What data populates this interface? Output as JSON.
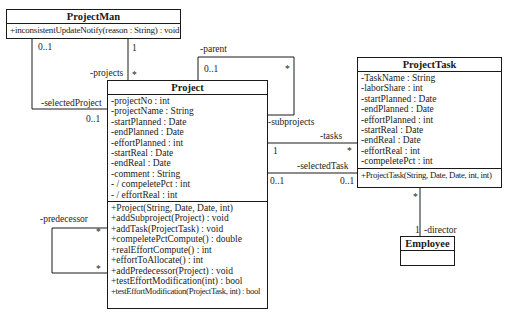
{
  "classes": {
    "projectman": {
      "name": "ProjectMan",
      "attributes": [],
      "methods": [
        "+inconsistentUpdateNotify(reason : String) : void"
      ]
    },
    "project": {
      "name": "Project",
      "attributes": [
        "-projectNo : int",
        "-projectName : String",
        "-startPlanned : Date",
        "-endPlanned : Date",
        "-effortPlanned : int",
        "-startReal : Date",
        "-endReal : Date",
        "-comment : String",
        "- / compeletePct : int",
        "- / effortReal : int"
      ],
      "methods": [
        "+Project(String, Date, Date, int)",
        "+addSubproject(Project) : void",
        "+addTask(ProjectTask) : void",
        "+compeletePctCompute() : double",
        "+realEffortCompute() : int",
        "+effortToAllocate() : int",
        "+addPredecessor(Project) : void",
        "+testEffortModification(int) : bool",
        "+testEffortModification(ProjectTask, int) : bool"
      ]
    },
    "projecttask": {
      "name": "ProjectTask",
      "attributes": [
        "-TaskName : String",
        "-laborShare : int",
        "-startPlanned : Date",
        "-endPlanned : Date",
        "-effortPlanned : int",
        "-startReal : Date",
        "-endReal : Date",
        "-effortReal : int",
        "-compeletePct : int"
      ],
      "methods": [
        "+ProjectTask(String, Date, Date, int, int)"
      ]
    },
    "employee": {
      "name": "Employee",
      "attributes": [],
      "methods": []
    }
  },
  "associations": {
    "projects": {
      "role": "-projects",
      "mult_source": "1",
      "mult_target": "*"
    },
    "selected_project": {
      "role": "-selectedProject",
      "mult_source": "0..1",
      "mult_target": "0..1"
    },
    "parent": {
      "role": "-parent",
      "mult": "0..1",
      "mult_other": "*"
    },
    "subprojects": {
      "role": "-subprojects"
    },
    "tasks": {
      "role": "-tasks",
      "mult_source": "1",
      "mult_target": "*"
    },
    "selected_task": {
      "role": "-selectedTask",
      "mult_source": "0..1",
      "mult_target": "0..1"
    },
    "predecessor": {
      "role": "-predecessor",
      "mult_a": "*",
      "mult_b": "*"
    },
    "director": {
      "role": "-director",
      "mult_source": "*",
      "mult_target": "1"
    }
  }
}
